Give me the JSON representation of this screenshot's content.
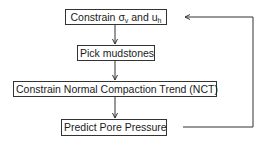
{
  "diagram": {
    "type": "flowchart",
    "nodes": [
      {
        "id": "n1",
        "label_main": "Constrain ",
        "sigma": "σ",
        "sigma_sub": "v",
        "and": " and u",
        "u_sub": "h",
        "full_label": "Constrain σv and uh"
      },
      {
        "id": "n2",
        "label": "Pick mudstones"
      },
      {
        "id": "n3",
        "label": "Constrain Normal Compaction Trend (NCT)"
      },
      {
        "id": "n4",
        "label": "Predict Pore Pressure"
      }
    ],
    "edges": [
      {
        "from": "n1",
        "to": "n2"
      },
      {
        "from": "n2",
        "to": "n3"
      },
      {
        "from": "n3",
        "to": "n4"
      },
      {
        "from": "n4",
        "to": "n1",
        "type": "feedback-loop"
      }
    ],
    "colors": {
      "line": "#333333",
      "background": "#ffffff",
      "text": "#1a1a1a"
    }
  }
}
